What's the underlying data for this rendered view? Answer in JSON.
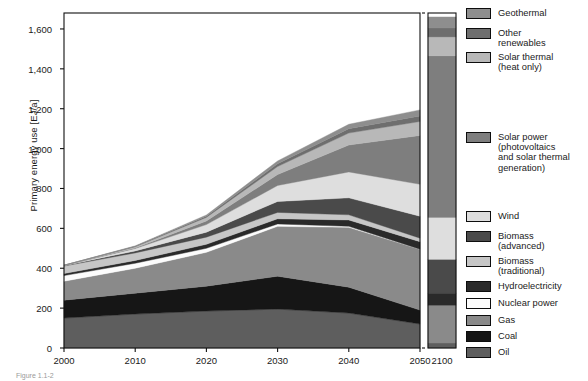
{
  "axes": {
    "ylabel": "Primary energy use [EJ/a]",
    "yticks": [
      0,
      200,
      400,
      600,
      800,
      1000,
      1200,
      1400,
      1600
    ],
    "yticklabels": [
      "0",
      "200",
      "400",
      "600",
      "800",
      "1,000",
      "1,200",
      "1,400",
      "1,600"
    ],
    "ylim": [
      0,
      1680
    ],
    "xticks": [
      2000,
      2010,
      2020,
      2030,
      2040,
      2050
    ],
    "xticklabels": [
      "2000",
      "2010",
      "2020",
      "2030",
      "2040",
      "2050"
    ],
    "break_label": "2100",
    "xlim": [
      2000,
      2050
    ]
  },
  "caption": "Figure 1.1-2",
  "legend": {
    "position": "right",
    "items": [
      {
        "label": "Geothermal",
        "color": "#8e8e8e"
      },
      {
        "label": "Other\nrenewables",
        "color": "#6e6e6e"
      },
      {
        "label": "Solar thermal\n(heat only)",
        "color": "#b8b8b8"
      },
      {
        "label": "Solar power\n(photovoltaics\nand solar thermal\ngeneration)",
        "color": "#7e7e7e"
      },
      {
        "label": "Wind",
        "color": "#dedede"
      },
      {
        "label": "Biomass\n(advanced)",
        "color": "#4a4a4a"
      },
      {
        "label": "Biomass\n(traditional)",
        "color": "#c6c6c6"
      },
      {
        "label": "Hydroelectricity",
        "color": "#2a2a2a"
      },
      {
        "label": "Nuclear power",
        "color": "#fcfcfc"
      },
      {
        "label": "Gas",
        "color": "#8a8a8a"
      },
      {
        "label": "Coal",
        "color": "#161616"
      },
      {
        "label": "Oil",
        "color": "#5e5e5e"
      }
    ]
  },
  "chart_data": {
    "type": "area",
    "title": "",
    "xlabel": "",
    "ylabel": "Primary energy use [EJ/a]",
    "ylim": [
      0,
      1680
    ],
    "grid": false,
    "stacked": true,
    "x": [
      2000,
      2010,
      2020,
      2030,
      2040,
      2050
    ],
    "x_break": [
      2050,
      2100
    ],
    "x_far": 2100,
    "series": [
      {
        "name": "Oil",
        "color": "#5e5e5e",
        "values": [
          150,
          170,
          185,
          195,
          175,
          120
        ],
        "value_2100": 25
      },
      {
        "name": "Coal",
        "color": "#161616",
        "values": [
          90,
          105,
          125,
          165,
          130,
          70
        ],
        "value_2100": 0
      },
      {
        "name": "Gas",
        "color": "#8a8a8a",
        "values": [
          95,
          125,
          170,
          250,
          300,
          305
        ],
        "value_2100": 190
      },
      {
        "name": "Nuclear power",
        "color": "#fcfcfc",
        "values": [
          28,
          25,
          20,
          12,
          5,
          0
        ],
        "value_2100": 0
      },
      {
        "name": "Hydroelectricity",
        "color": "#2a2a2a",
        "values": [
          10,
          14,
          20,
          26,
          32,
          38
        ],
        "value_2100": 60
      },
      {
        "name": "Biomass (traditional)",
        "color": "#c6c6c6",
        "values": [
          38,
          38,
          36,
          32,
          26,
          18
        ],
        "value_2100": 0
      },
      {
        "name": "Biomass (advanced)",
        "color": "#4a4a4a",
        "values": [
          2,
          10,
          25,
          55,
          85,
          110
        ],
        "value_2100": 170
      },
      {
        "name": "Wind",
        "color": "#dedede",
        "values": [
          1,
          12,
          38,
          80,
          130,
          160
        ],
        "value_2100": 210
      },
      {
        "name": "Solar power (photovoltaics and solar thermal generation)",
        "color": "#7e7e7e",
        "values": [
          0,
          3,
          18,
          55,
          135,
          245
        ],
        "value_2100": 810
      },
      {
        "name": "Solar thermal (heat only)",
        "color": "#b8b8b8",
        "values": [
          1,
          6,
          18,
          40,
          60,
          70
        ],
        "value_2100": 95
      },
      {
        "name": "Other renewables",
        "color": "#6e6e6e",
        "values": [
          0,
          2,
          6,
          14,
          22,
          28
        ],
        "value_2100": 45
      },
      {
        "name": "Geothermal",
        "color": "#8e8e8e",
        "values": [
          0,
          2,
          6,
          14,
          22,
          30
        ],
        "value_2100": 55
      }
    ],
    "totals": [
      415,
      512,
      667,
      938,
      1122,
      1194
    ],
    "total_2100": 1660
  }
}
